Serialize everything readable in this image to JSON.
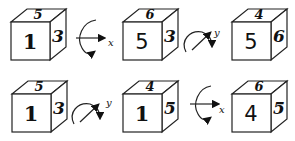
{
  "diagram": {
    "rows": [
      {
        "items": [
          {
            "type": "cube",
            "front": "1",
            "top": "5",
            "side": "3"
          },
          {
            "type": "rotation",
            "axis": "x"
          },
          {
            "type": "cube",
            "front": "5",
            "top": "6",
            "side": "3"
          },
          {
            "type": "rotation",
            "axis": "y"
          },
          {
            "type": "cube",
            "front": "5",
            "top": "4",
            "side": "6"
          }
        ]
      },
      {
        "items": [
          {
            "type": "cube",
            "front": "1",
            "top": "5",
            "side": "3"
          },
          {
            "type": "rotation",
            "axis": "y"
          },
          {
            "type": "cube",
            "front": "1",
            "top": "4",
            "side": "5"
          },
          {
            "type": "rotation",
            "axis": "x"
          },
          {
            "type": "cube",
            "front": "4",
            "top": "6",
            "side": "5"
          }
        ]
      }
    ]
  }
}
